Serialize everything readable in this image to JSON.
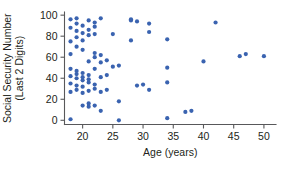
{
  "chart_data": {
    "type": "scatter",
    "title": "",
    "xlabel": "Age (years)",
    "ylabel": "Social Security Number (Last 2 Digits)",
    "ylabel_line1": "Social Security Number",
    "ylabel_line2": "(Last 2 Digits)",
    "xlim": [
      17,
      52
    ],
    "ylim": [
      -4,
      103
    ],
    "xticks": [
      20,
      25,
      30,
      35,
      40,
      45,
      50
    ],
    "yticks": [
      0,
      20,
      40,
      60,
      80,
      100
    ],
    "xtick_labels": [
      "20",
      "25",
      "30",
      "35",
      "40",
      "45",
      "50"
    ],
    "ytick_labels": [
      "0",
      "20",
      "40",
      "60",
      "80",
      "100"
    ],
    "grid": false,
    "legend": null,
    "marker": "circle",
    "marker_color": "#3a63b0",
    "axis_color": "#58585a",
    "text_color": "#231f20",
    "background": "#ffffff",
    "series": [
      {
        "name": "students",
        "points": [
          [
            18,
            1
          ],
          [
            18,
            27
          ],
          [
            18,
            35
          ],
          [
            18,
            42
          ],
          [
            18,
            49
          ],
          [
            18,
            63
          ],
          [
            18,
            75
          ],
          [
            18,
            88
          ],
          [
            18,
            96
          ],
          [
            19,
            29
          ],
          [
            19,
            33
          ],
          [
            19,
            40
          ],
          [
            19,
            44
          ],
          [
            19,
            47
          ],
          [
            19,
            70
          ],
          [
            19,
            79
          ],
          [
            19,
            85
          ],
          [
            19,
            92
          ],
          [
            19,
            97
          ],
          [
            20,
            14
          ],
          [
            20,
            26
          ],
          [
            20,
            32
          ],
          [
            20,
            38
          ],
          [
            20,
            41
          ],
          [
            20,
            45
          ],
          [
            20,
            67
          ],
          [
            20,
            76
          ],
          [
            20,
            83
          ],
          [
            20,
            90
          ],
          [
            21,
            13
          ],
          [
            21,
            16
          ],
          [
            21,
            28
          ],
          [
            21,
            36
          ],
          [
            21,
            39
          ],
          [
            21,
            43
          ],
          [
            21,
            56
          ],
          [
            21,
            81
          ],
          [
            21,
            86
          ],
          [
            21,
            95
          ],
          [
            22,
            14
          ],
          [
            22,
            30
          ],
          [
            22,
            34
          ],
          [
            22,
            49
          ],
          [
            22,
            60
          ],
          [
            22,
            64
          ],
          [
            22,
            82
          ],
          [
            22,
            89
          ],
          [
            22,
            93
          ],
          [
            23,
            9
          ],
          [
            23,
            27
          ],
          [
            23,
            41
          ],
          [
            23,
            55
          ],
          [
            23,
            62
          ],
          [
            23,
            97
          ],
          [
            24,
            29
          ],
          [
            24,
            43
          ],
          [
            24,
            57
          ],
          [
            25,
            51
          ],
          [
            25,
            82
          ],
          [
            26,
            0
          ],
          [
            26,
            18
          ],
          [
            26,
            52
          ],
          [
            28,
            76
          ],
          [
            28,
            96
          ],
          [
            28,
            95
          ],
          [
            29,
            33
          ],
          [
            29,
            94
          ],
          [
            30,
            34
          ],
          [
            31,
            29
          ],
          [
            31,
            84
          ],
          [
            31,
            92
          ],
          [
            34,
            2
          ],
          [
            34,
            36
          ],
          [
            34,
            50
          ],
          [
            34,
            77
          ],
          [
            37,
            8
          ],
          [
            38,
            9
          ],
          [
            40,
            56
          ],
          [
            42,
            93
          ],
          [
            46,
            61
          ],
          [
            47,
            63
          ],
          [
            50,
            61
          ]
        ]
      }
    ]
  }
}
